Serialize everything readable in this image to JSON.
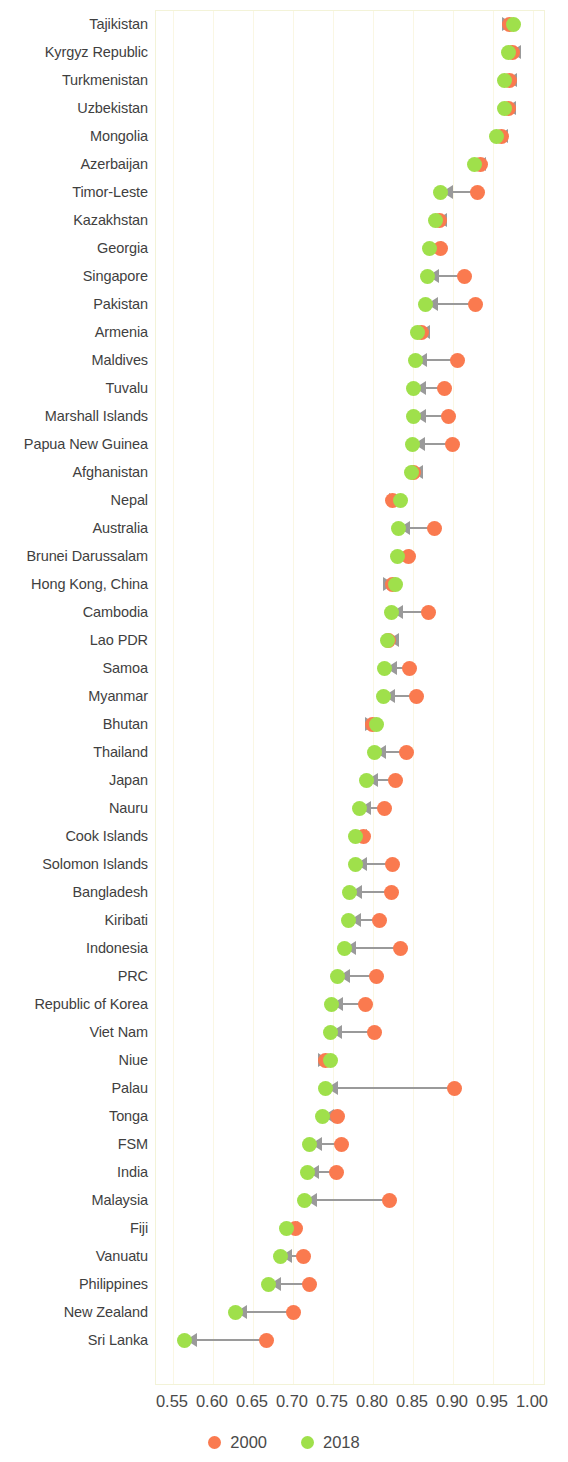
{
  "chart_data": {
    "type": "dumbbell",
    "title": "",
    "subtitle": "",
    "xlabel": "",
    "ylabel": "",
    "xlim": [
      0.55,
      1.0
    ],
    "xticks": [
      "0.55",
      "0.60",
      "0.65",
      "0.70",
      "0.75",
      "0.80",
      "0.85",
      "0.90",
      "0.95",
      "1.00"
    ],
    "xtick_values": [
      0.55,
      0.6,
      0.65,
      0.7,
      0.75,
      0.8,
      0.85,
      0.9,
      0.95,
      1.0
    ],
    "grid": true,
    "grid_axis": "x",
    "legend_position": "bottom",
    "series": [
      {
        "name": "2000",
        "color": "#fa7a4f"
      },
      {
        "name": "2018",
        "color": "#9fe04b"
      }
    ],
    "categories": [
      "Tajikistan",
      "Kyrgyz Republic",
      "Turkmenistan",
      "Uzbekistan",
      "Mongolia",
      "Azerbaijan",
      "Timor-Leste",
      "Kazakhstan",
      "Georgia",
      "Singapore",
      "Pakistan",
      "Armenia",
      "Maldives",
      "Tuvalu",
      "Marshall Islands",
      "Papua New Guinea",
      "Afghanistan",
      "Nepal",
      "Australia",
      "Brunei Darussalam",
      "Hong Kong, China",
      "Cambodia",
      "Lao PDR",
      "Samoa",
      "Myanmar",
      "Bhutan",
      "Thailand",
      "Japan",
      "Nauru",
      "Cook Islands",
      "Solomon Islands",
      "Bangladesh",
      "Kiribati",
      "Indonesia",
      "PRC",
      "Republic of Korea",
      "Viet Nam",
      "Niue",
      "Palau",
      "Tonga",
      "FSM",
      "India",
      "Malaysia",
      "Fiji",
      "Vanuatu",
      "Philippines",
      "New Zealand",
      "Sri Lanka"
    ],
    "rows": [
      {
        "category": "Tajikistan",
        "v2000": 0.972,
        "v2018": 0.977
      },
      {
        "category": "Kyrgyz Republic",
        "v2000": 0.975,
        "v2018": 0.971
      },
      {
        "category": "Turkmenistan",
        "v2000": 0.972,
        "v2018": 0.966
      },
      {
        "category": "Uzbekistan",
        "v2000": 0.971,
        "v2018": 0.965
      },
      {
        "category": "Mongolia",
        "v2000": 0.962,
        "v2018": 0.955
      },
      {
        "category": "Azerbaijan",
        "v2000": 0.936,
        "v2018": 0.928
      },
      {
        "category": "Timor-Leste",
        "v2000": 0.932,
        "v2018": 0.886
      },
      {
        "category": "Kazakhstan",
        "v2000": 0.884,
        "v2018": 0.879
      },
      {
        "category": "Georgia",
        "v2000": 0.886,
        "v2018": 0.872
      },
      {
        "category": "Singapore",
        "v2000": 0.915,
        "v2018": 0.869
      },
      {
        "category": "Pakistan",
        "v2000": 0.929,
        "v2018": 0.867
      },
      {
        "category": "Armenia",
        "v2000": 0.862,
        "v2018": 0.857
      },
      {
        "category": "Maldives",
        "v2000": 0.907,
        "v2018": 0.854
      },
      {
        "category": "Tuvalu",
        "v2000": 0.891,
        "v2018": 0.852
      },
      {
        "category": "Marshall Islands",
        "v2000": 0.896,
        "v2018": 0.852
      },
      {
        "category": "Papua New Guinea",
        "v2000": 0.901,
        "v2018": 0.851
      },
      {
        "category": "Afghanistan",
        "v2000": 0.852,
        "v2018": 0.849
      },
      {
        "category": "Nepal",
        "v2000": 0.826,
        "v2018": 0.836
      },
      {
        "category": "Australia",
        "v2000": 0.878,
        "v2018": 0.833
      },
      {
        "category": "Brunei Darussalam",
        "v2000": 0.846,
        "v2018": 0.832
      },
      {
        "category": "Hong Kong, China",
        "v2000": 0.826,
        "v2018": 0.829
      },
      {
        "category": "Cambodia",
        "v2000": 0.871,
        "v2018": 0.824
      },
      {
        "category": "Lao PDR",
        "v2000": 0.821,
        "v2018": 0.819
      },
      {
        "category": "Samoa",
        "v2000": 0.847,
        "v2018": 0.816
      },
      {
        "category": "Myanmar",
        "v2000": 0.856,
        "v2018": 0.814
      },
      {
        "category": "Bhutan",
        "v2000": 0.801,
        "v2018": 0.806
      },
      {
        "category": "Thailand",
        "v2000": 0.843,
        "v2018": 0.803
      },
      {
        "category": "Japan",
        "v2000": 0.829,
        "v2018": 0.793
      },
      {
        "category": "Nauru",
        "v2000": 0.816,
        "v2018": 0.784
      },
      {
        "category": "Cook Islands",
        "v2000": 0.789,
        "v2018": 0.779
      },
      {
        "category": "Solomon Islands",
        "v2000": 0.825,
        "v2018": 0.779
      },
      {
        "category": "Bangladesh",
        "v2000": 0.824,
        "v2018": 0.772
      },
      {
        "category": "Kiribati",
        "v2000": 0.809,
        "v2018": 0.771
      },
      {
        "category": "Indonesia",
        "v2000": 0.835,
        "v2018": 0.765
      },
      {
        "category": "PRC",
        "v2000": 0.806,
        "v2018": 0.757
      },
      {
        "category": "Republic of Korea",
        "v2000": 0.792,
        "v2018": 0.749
      },
      {
        "category": "Viet Nam",
        "v2000": 0.803,
        "v2018": 0.748
      },
      {
        "category": "Niue",
        "v2000": 0.742,
        "v2018": 0.748
      },
      {
        "category": "Palau",
        "v2000": 0.903,
        "v2018": 0.742
      },
      {
        "category": "Tonga",
        "v2000": 0.757,
        "v2018": 0.738
      },
      {
        "category": "FSM",
        "v2000": 0.762,
        "v2018": 0.722
      },
      {
        "category": "India",
        "v2000": 0.755,
        "v2018": 0.719
      },
      {
        "category": "Malaysia",
        "v2000": 0.822,
        "v2018": 0.716
      },
      {
        "category": "Fiji",
        "v2000": 0.704,
        "v2018": 0.693
      },
      {
        "category": "Vanuatu",
        "v2000": 0.714,
        "v2018": 0.685
      },
      {
        "category": "Philippines",
        "v2000": 0.722,
        "v2018": 0.671
      },
      {
        "category": "New Zealand",
        "v2000": 0.702,
        "v2018": 0.629
      },
      {
        "category": "Sri Lanka",
        "v2000": 0.668,
        "v2018": 0.566
      }
    ]
  },
  "legend": {
    "items": [
      {
        "label": "2000",
        "color": "#fa7a4f"
      },
      {
        "label": "2018",
        "color": "#9fe04b"
      }
    ]
  },
  "colors": {
    "series_2000": "#fa7a4f",
    "series_2018": "#9fe04b",
    "connector": "#9a9a9a",
    "gridline": "#faf7e4",
    "plot_border": "#f3f3d8",
    "text": "#4a4a4a"
  }
}
